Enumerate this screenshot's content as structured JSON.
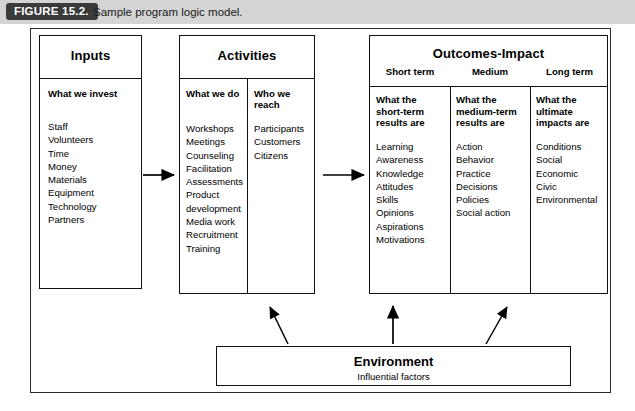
{
  "figure": {
    "badge": "FIGURE 15.2.",
    "caption": "Sample program logic model."
  },
  "diagram": {
    "type": "program-logic-model",
    "columns": [
      {
        "id": "inputs",
        "title": "Inputs",
        "subheading": "What we invest",
        "items": [
          "Staff",
          "Volunteers",
          "Time",
          "Money",
          "Materials",
          "Equipment",
          "Technology",
          "Partners"
        ]
      },
      {
        "id": "activities",
        "title": "Activities",
        "subcolumns": [
          {
            "heading": "What we do",
            "items": [
              "Workshops",
              "Meetings",
              "Counseling",
              "Facilitation",
              "Assessments",
              "Product",
              "development",
              "Media work",
              "Recruitment",
              "Training"
            ]
          },
          {
            "heading_line1": "Who we",
            "heading_line2": "reach",
            "items": [
              "Participants",
              "Customers",
              "Citizens"
            ]
          }
        ]
      },
      {
        "id": "outcomes",
        "title": "Outcomes-Impact",
        "subcolumns": [
          {
            "term": "Short term",
            "subheading_line1": "What the",
            "subheading_line2": "short-term",
            "subheading_line3": "results are",
            "lead": "Learning",
            "items": [
              "Awareness",
              "Knowledge",
              "Attitudes",
              "Skills",
              "Opinions",
              "Aspirations",
              "Motivations"
            ]
          },
          {
            "term": "Medium",
            "subheading_line1": "What the",
            "subheading_line2": "medium-term",
            "subheading_line3": "results are",
            "lead": "Action",
            "items": [
              "Behavior",
              "Practice",
              "Decisions",
              "Policies",
              "Social action"
            ]
          },
          {
            "term": "Long term",
            "subheading_line1": "What the",
            "subheading_line2": "ultimate",
            "subheading_line3": "impacts are",
            "lead": "Conditions",
            "items": [
              "Social",
              "Economic",
              "Civic",
              "Environmental"
            ]
          }
        ]
      }
    ],
    "environment": {
      "title": "Environment",
      "subtitle": "Influential factors"
    }
  },
  "colors": {
    "badge_background": "#3a3a3a",
    "badge_text": "#ffffff",
    "caption_background": "#d4d4d4",
    "line": "#111111",
    "page_background": "#ffffff"
  }
}
